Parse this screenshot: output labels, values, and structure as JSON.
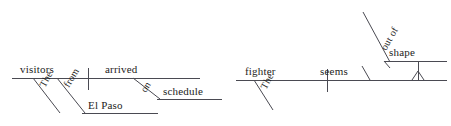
{
  "page": {
    "background_color": "#ffffff",
    "line_color": "#4a4a52",
    "text_color": "#1d1d22",
    "width": 451,
    "height": 126
  },
  "diagrams": [
    {
      "id": "diagram-left",
      "sentence": "The visitors from El Paso arrived on schedule.",
      "subject": "visitors",
      "verb": "arrived",
      "words": {
        "subject": "visitors",
        "subject_article": "The",
        "preposition_1": "from",
        "object_of_preposition_1": "El Paso",
        "verb": "arrived",
        "preposition_2": "on",
        "object_of_preposition_2": "schedule"
      }
    },
    {
      "id": "diagram-right",
      "sentence": "The fighter seems out of shape.",
      "subject": "fighter",
      "verb": "seems",
      "words": {
        "subject": "fighter",
        "subject_article": "The",
        "verb": "seems",
        "preposition": "out of",
        "predicate_complement": "shape"
      }
    }
  ]
}
